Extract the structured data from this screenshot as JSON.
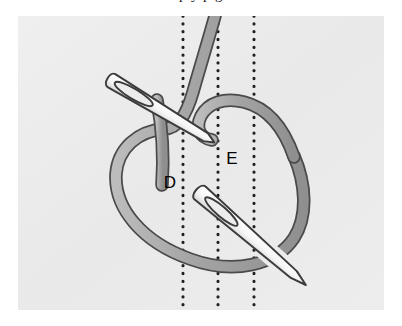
{
  "page": {
    "background_color": "#ffffff",
    "clipped_caption_text": "p   y   p   g"
  },
  "figure": {
    "panel": {
      "background_color": "#ececec",
      "left": 18,
      "top": 16,
      "width": 366,
      "height": 294
    },
    "labels": [
      {
        "id": "label-d",
        "text": "D",
        "x": 170,
        "y": 182
      },
      {
        "id": "label-e",
        "text": "E",
        "x": 232,
        "y": 158
      }
    ],
    "guide_lines": {
      "style": "dotted",
      "color": "#1a1a1a",
      "orientation": "vertical",
      "x_positions": [
        183,
        218,
        254
      ],
      "count": 3
    },
    "thread": {
      "fill_color": "#a8a8a8",
      "outline_color": "#4a4a4a",
      "width": 11,
      "description": "Gray thread forming a large open loop with a crossing knot at upper right"
    },
    "needles": {
      "count": 2,
      "fill_color": "#fbfbfb",
      "outline_color": "#3c3c3c",
      "items": [
        {
          "id": "needle-upper",
          "has_eye": true,
          "orientation": "angled-down-right"
        },
        {
          "id": "needle-lower",
          "has_eye": true,
          "orientation": "angled-down-right"
        }
      ]
    }
  }
}
